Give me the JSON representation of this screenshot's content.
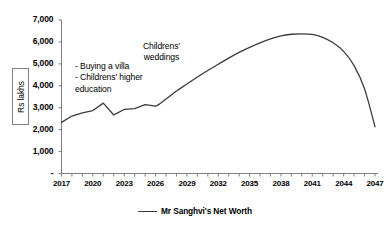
{
  "chart_data": {
    "type": "line",
    "title": "",
    "xlabel": "",
    "ylabel": "Rs lakhs",
    "xlim": [
      2017,
      2047
    ],
    "ylim": [
      0,
      7000
    ],
    "grid": false,
    "legend_position": "bottom",
    "y_ticks": [
      "-",
      "1,000",
      "2,000",
      "3,000",
      "4,000",
      "5,000",
      "6,000",
      "7,000"
    ],
    "y_tick_values": [
      0,
      1000,
      2000,
      3000,
      4000,
      5000,
      6000,
      7000
    ],
    "x_ticks": [
      "2017",
      "2020",
      "2023",
      "2026",
      "2029",
      "2032",
      "2035",
      "2038",
      "2041",
      "2044",
      "2047"
    ],
    "x_tick_values": [
      2017,
      2020,
      2023,
      2026,
      2029,
      2032,
      2035,
      2038,
      2041,
      2044,
      2047
    ],
    "x_minor_tick_interval": 1,
    "series": [
      {
        "name": "Mr Sanghvi's Net Worth",
        "color": "#3b3b3b",
        "x": [
          2017,
          2018,
          2019,
          2020,
          2021,
          2022,
          2023,
          2024,
          2025,
          2026,
          2027,
          2028,
          2029,
          2030,
          2031,
          2032,
          2033,
          2034,
          2035,
          2036,
          2037,
          2038,
          2039,
          2040,
          2041,
          2042,
          2043,
          2044,
          2045,
          2046,
          2047
        ],
        "values": [
          2330,
          2620,
          2760,
          2870,
          3210,
          2670,
          2920,
          2960,
          3140,
          3070,
          3400,
          3760,
          4080,
          4400,
          4700,
          4980,
          5260,
          5520,
          5750,
          5960,
          6140,
          6280,
          6350,
          6370,
          6340,
          6210,
          5960,
          5570,
          4920,
          3860,
          2130
        ]
      }
    ],
    "annotations": [
      {
        "name": "events",
        "text": "- Buying a villa\n- Childrens' higher\neducation"
      },
      {
        "name": "weddings",
        "text": "Childrens'\nweddings"
      }
    ]
  },
  "legend": {
    "label": "Mr Sanghvi's Net Worth"
  }
}
